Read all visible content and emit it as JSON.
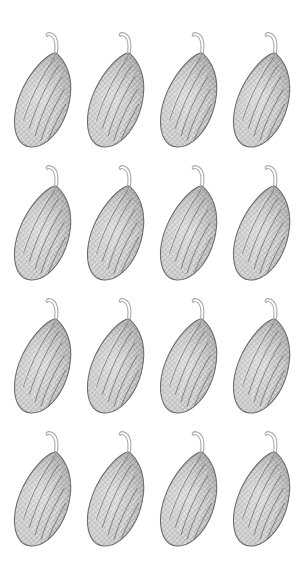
{
  "canvas": {
    "width": 299,
    "height": 580,
    "background_color": "#ffffff",
    "subject": "leaf",
    "render_style": "pen-and-ink cross-hatch engraving",
    "arrangement": "repeating grid"
  },
  "grid": {
    "rows": 4,
    "columns": 4,
    "total_tiles": 16,
    "column_pitch_px": 73,
    "row_pitch_px": 133,
    "origin_x_px": 8,
    "origin_y_px": 20,
    "cell_width_px": 73,
    "cell_height_px": 133
  },
  "motif": {
    "name": "ovate-leaf-with-curved-petiole",
    "orientation": "tilted, apex upper-right, base lower-left",
    "blade": {
      "shape": "asymmetric ovate / obovate",
      "width_px": 50,
      "height_px": 86,
      "outline_color": "#6e6e6e",
      "fill_base_color": "#b4b4b4",
      "hatch_color": "#5a5a5a",
      "hatch_color_light": "#8d8d8d",
      "highlight_color": "#e8e8e8",
      "hatch_directions_deg": [
        45,
        -45,
        8
      ],
      "hatch_spacing_px": 2
    },
    "petiole": {
      "shape": "thin hooked stem curving up then left",
      "length_px": 34,
      "stroke_color": "#a9a9a9",
      "stroke_width_px": 1,
      "outlined": true
    }
  },
  "palette": {
    "background": "#ffffff",
    "ink_dark": "#4f4f4f",
    "ink_mid": "#8a8a8a",
    "ink_light": "#c2c2c2",
    "stem": "#a9a9a9"
  },
  "tiles": [
    {
      "id": "leaf-r1-c1",
      "row": 1,
      "column": 1,
      "x": 8,
      "y": 20
    },
    {
      "id": "leaf-r1-c2",
      "row": 1,
      "column": 2,
      "x": 81,
      "y": 20
    },
    {
      "id": "leaf-r1-c3",
      "row": 1,
      "column": 3,
      "x": 154,
      "y": 20
    },
    {
      "id": "leaf-r1-c4",
      "row": 1,
      "column": 4,
      "x": 227,
      "y": 20
    },
    {
      "id": "leaf-r2-c1",
      "row": 2,
      "column": 1,
      "x": 8,
      "y": 153
    },
    {
      "id": "leaf-r2-c2",
      "row": 2,
      "column": 2,
      "x": 81,
      "y": 153
    },
    {
      "id": "leaf-r2-c3",
      "row": 2,
      "column": 3,
      "x": 154,
      "y": 153
    },
    {
      "id": "leaf-r2-c4",
      "row": 2,
      "column": 4,
      "x": 227,
      "y": 153
    },
    {
      "id": "leaf-r3-c1",
      "row": 3,
      "column": 1,
      "x": 8,
      "y": 286
    },
    {
      "id": "leaf-r3-c2",
      "row": 3,
      "column": 2,
      "x": 81,
      "y": 286
    },
    {
      "id": "leaf-r3-c3",
      "row": 3,
      "column": 3,
      "x": 154,
      "y": 286
    },
    {
      "id": "leaf-r3-c4",
      "row": 3,
      "column": 4,
      "x": 227,
      "y": 286
    },
    {
      "id": "leaf-r4-c1",
      "row": 4,
      "column": 1,
      "x": 8,
      "y": 419
    },
    {
      "id": "leaf-r4-c2",
      "row": 4,
      "column": 2,
      "x": 81,
      "y": 419
    },
    {
      "id": "leaf-r4-c3",
      "row": 4,
      "column": 3,
      "x": 154,
      "y": 419
    },
    {
      "id": "leaf-r4-c4",
      "row": 4,
      "column": 4,
      "x": 227,
      "y": 419
    }
  ]
}
